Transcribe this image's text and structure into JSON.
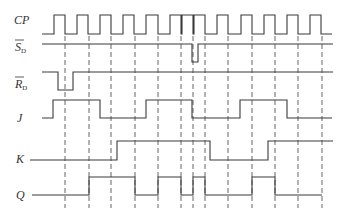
{
  "diagram": {
    "signals": [
      {
        "id": "cp",
        "label": "CP",
        "overbar": false,
        "sub": "",
        "label_y": 24
      },
      {
        "id": "sd",
        "label": "S",
        "overbar": true,
        "sub": "D",
        "label_y": 51
      },
      {
        "id": "rd",
        "label": "R",
        "overbar": true,
        "sub": "D",
        "label_y": 88
      },
      {
        "id": "j",
        "label": "J",
        "overbar": false,
        "sub": "",
        "label_y": 122
      },
      {
        "id": "k",
        "label": "K",
        "overbar": false,
        "sub": "",
        "label_y": 163
      },
      {
        "id": "q",
        "label": "Q",
        "overbar": false,
        "sub": "",
        "label_y": 199
      }
    ],
    "waveforms": {
      "cp": "M42,34 H54 V15 H65 V34 H77 V15 H88 V34 H100 V15 H111 V34 H123 V15 H134 V34 H146 V15 H158 V34 H170 V15 H181 V34 H182 V15 H193 V34 H194 V15 H205 V34 H217 V15 H228 V34 H241 V15 H252 V34 H264 V15 H275 V34 H287 V15 H298 V34 H310 V15 H321 V34 H332",
      "sd": "M42,44 H192 V62 H198 V44 H333",
      "rd": "M42,72 H58 V90 H73 V72 H333",
      "j": "M42,118 H53 V100 H100 V118 H146 V100 H192 V118 H240 V100 H287 V118 H332",
      "k": "M30,160 H117 V141 H210 V160 H268 V141 H333",
      "q": "M32,195 H89 V177 H135 V195 H158 V177 H181 V195 H193 V177 H205 V195 H252 V177 H275 V195 H322"
    },
    "clock_falling_edges": [
      65,
      89,
      111,
      135,
      158,
      181,
      193,
      205,
      228,
      252,
      275,
      298,
      322
    ],
    "dashed_top": 36,
    "dashed_bottom": 208,
    "colors": {
      "line": "#3a3a3a",
      "dash": "#555555",
      "background": "#ffffff"
    }
  }
}
